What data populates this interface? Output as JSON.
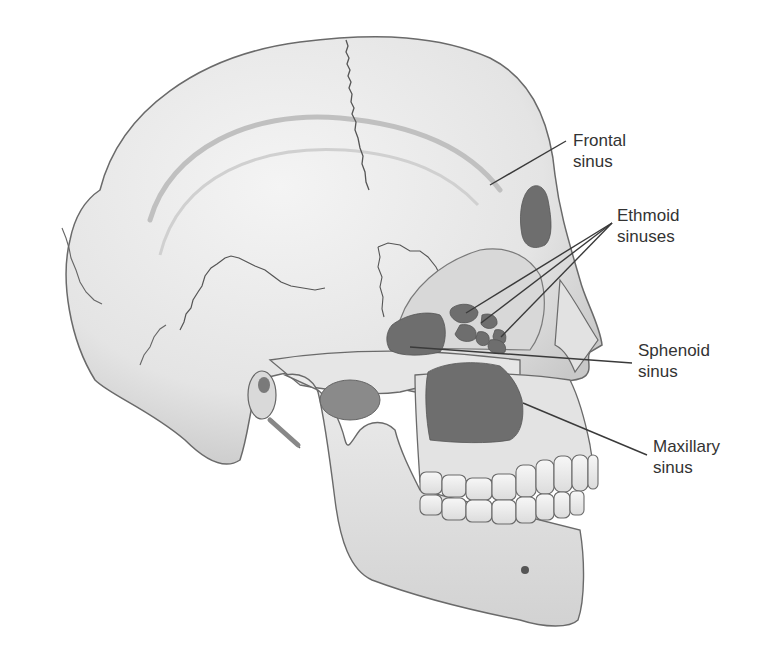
{
  "figure": {
    "colors": {
      "background": "#ffffff",
      "bone": "#e9e9e9",
      "bone_shadow": "#bdbdbd",
      "outline": "#6a6a6a",
      "sinus": "#6e6e6e",
      "suture": "#555555",
      "leader_line": "#3a3a3a",
      "text": "#333333"
    }
  },
  "labels": [
    {
      "id": "frontal",
      "line1": "Frontal",
      "line2": "sinus",
      "x": 573,
      "y": 130,
      "leaders": [
        [
          566,
          141,
          490,
          185
        ]
      ]
    },
    {
      "id": "ethmoid",
      "line1": "Ethmoid",
      "line2": "sinuses",
      "x": 617,
      "y": 205,
      "leaders": [
        [
          612,
          223,
          466,
          313
        ],
        [
          612,
          223,
          481,
          323
        ],
        [
          612,
          223,
          501,
          337
        ]
      ]
    },
    {
      "id": "sphenoid",
      "line1": "Sphenoid",
      "line2": "sinus",
      "x": 638,
      "y": 340,
      "leaders": [
        [
          632,
          363,
          410,
          347
        ]
      ]
    },
    {
      "id": "maxillary",
      "line1": "Maxillary",
      "line2": "sinus",
      "x": 653,
      "y": 436,
      "leaders": [
        [
          647,
          455,
          523,
          403
        ]
      ]
    }
  ]
}
